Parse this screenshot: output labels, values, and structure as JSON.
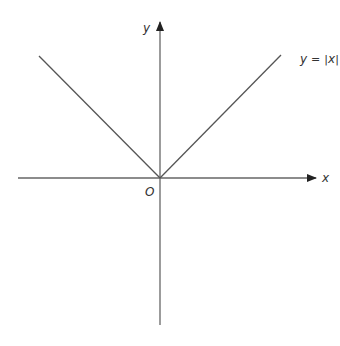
{
  "diagram": {
    "type": "function-graph",
    "x_axis_label": "x",
    "y_axis_label": "y",
    "origin_label": "O",
    "function_label_y": "y",
    "function_label_eq": "=",
    "function_label_expr": "|x|",
    "function_label_x": "x",
    "function": "y=|x|",
    "colors": {
      "axis": "#555555",
      "line": "#555555",
      "text": "#333333"
    }
  }
}
